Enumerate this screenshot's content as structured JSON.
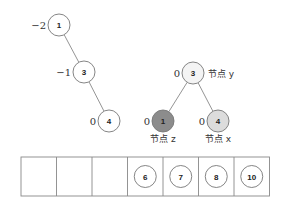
{
  "left_tree": {
    "nodes": [
      {
        "key": "1",
        "balance": "−2",
        "cx": 59,
        "cy": 25,
        "fill": "#ffffff"
      },
      {
        "key": "3",
        "balance": "−1",
        "cx": 84,
        "cy": 72,
        "fill": "#ffffff"
      },
      {
        "key": "4",
        "balance": "0",
        "cx": 109,
        "cy": 121,
        "fill": "#ffffff"
      }
    ],
    "edges": [
      [
        0,
        1
      ],
      [
        1,
        2
      ]
    ]
  },
  "right_tree": {
    "nodes": [
      {
        "key": "3",
        "balance": "0",
        "cx": 193,
        "cy": 73,
        "fill": "#f4f4f4",
        "label": "节点 y"
      },
      {
        "key": "1",
        "balance": "0",
        "cx": 163,
        "cy": 121,
        "fill": "#8c8c8c",
        "label": "节点 z"
      },
      {
        "key": "4",
        "balance": "0",
        "cx": 218,
        "cy": 121,
        "fill": "#dcdcdc",
        "label": "节点 x"
      }
    ],
    "edges": [
      [
        0,
        1
      ],
      [
        0,
        2
      ]
    ]
  },
  "array": {
    "cells": [
      "",
      "",
      "",
      "6",
      "7",
      "8",
      "10"
    ]
  },
  "colors": {
    "stroke": "#777777",
    "edge": "#888888",
    "cell_border": "#888888"
  }
}
